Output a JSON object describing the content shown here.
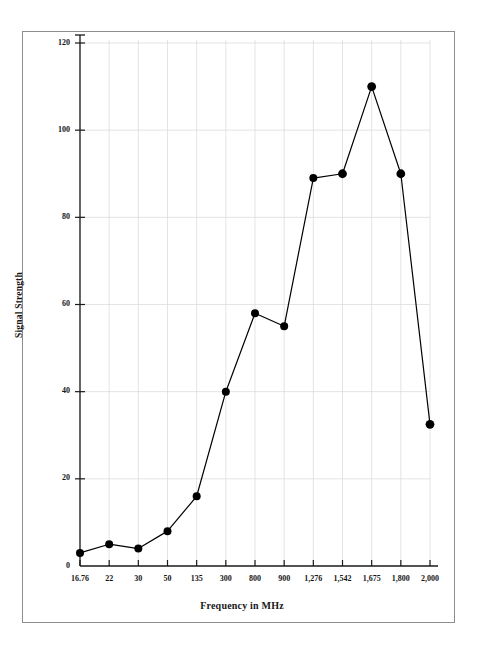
{
  "figure": {
    "frame_color": "#8d8d8d",
    "background": "#ffffff"
  },
  "chart_data": {
    "type": "line",
    "title": "",
    "subtitle": "",
    "xlabel": "Frequency in MHz",
    "ylabel": "Signal Strength",
    "categories": [
      "16.76",
      "22",
      "30",
      "50",
      "135",
      "300",
      "800",
      "900",
      "1,276",
      "1,542",
      "1,675",
      "1,800",
      "2,000"
    ],
    "values": [
      3,
      5,
      4,
      8,
      16,
      40,
      58,
      55,
      89,
      90,
      110,
      90,
      32.5
    ],
    "series": [
      {
        "name": "Signal Strength",
        "values": [
          3,
          5,
          4,
          8,
          16,
          40,
          58,
          55,
          89,
          90,
          110,
          90,
          32.5
        ]
      }
    ],
    "y_ticks": [
      0,
      20,
      40,
      60,
      80,
      100,
      120
    ],
    "y_tick_labels": [
      "0",
      "20",
      "40",
      "60",
      "80",
      "100",
      "120"
    ],
    "ylim": [
      0,
      123
    ],
    "xlim_categorical": true,
    "grid": true,
    "grid_color": "#d9d9d9",
    "legend": "none",
    "marker": "filled-circle",
    "marker_color": "#000000",
    "line_color": "#000000",
    "line_width": 1.2,
    "annotations": []
  }
}
